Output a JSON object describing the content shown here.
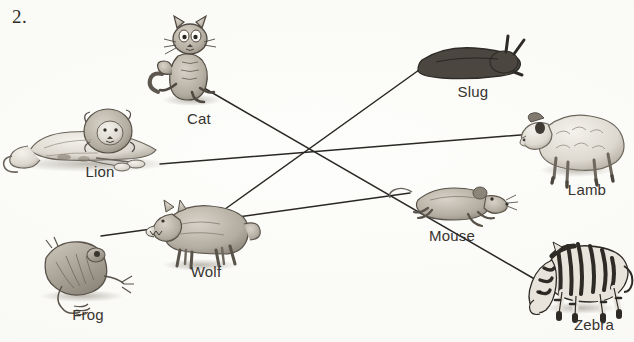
{
  "worksheet": {
    "exercise_number": "2.",
    "background_color": "#fdfdfb",
    "line_color": "#2a2724"
  },
  "labels": {
    "cat": "Cat",
    "lion": "Lion",
    "frog": "Frog",
    "wolf": "Wolf",
    "slug": "Slug",
    "lamb": "Lamb",
    "mouse": "Mouse",
    "zebra": "Zebra"
  },
  "animals": [
    {
      "id": "cat",
      "label": "Cat",
      "label_x": 199,
      "label_y": 119,
      "art_cx": 187,
      "art_cy": 68
    },
    {
      "id": "lion",
      "label": "Lion",
      "label_x": 100,
      "label_y": 172,
      "art_cx": 92,
      "art_cy": 141
    },
    {
      "id": "frog",
      "label": "Frog",
      "label_x": 88,
      "label_y": 315,
      "art_cx": 78,
      "art_cy": 268
    },
    {
      "id": "wolf",
      "label": "Wolf",
      "label_x": 206,
      "label_y": 272,
      "art_cx": 196,
      "art_cy": 232
    },
    {
      "id": "slug",
      "label": "Slug",
      "label_x": 473,
      "label_y": 92,
      "art_cx": 468,
      "art_cy": 58
    },
    {
      "id": "lamb",
      "label": "Lamb",
      "label_x": 587,
      "label_y": 190,
      "art_cx": 573,
      "art_cy": 144
    },
    {
      "id": "mouse",
      "label": "Mouse",
      "label_x": 452,
      "label_y": 236,
      "art_cx": 455,
      "art_cy": 203
    },
    {
      "id": "zebra",
      "label": "Zebra",
      "label_x": 594,
      "label_y": 325,
      "art_cx": 578,
      "art_cy": 275
    }
  ],
  "connections": [
    {
      "id": "lion-lamb",
      "from": "lion",
      "to": "lamb",
      "x1": 160,
      "y1": 164,
      "x2": 545,
      "y2": 133
    },
    {
      "id": "cat-zebra",
      "from": "cat",
      "to": "zebra",
      "x1": 204,
      "y1": 88,
      "x2": 538,
      "y2": 281
    },
    {
      "id": "slug-wolf",
      "from": "slug",
      "to": "wolf",
      "x1": 419,
      "y1": 70,
      "x2": 221,
      "y2": 212
    },
    {
      "id": "frog-mouse",
      "from": "frog",
      "to": "mouse",
      "x1": 101,
      "y1": 236,
      "x2": 410,
      "y2": 193
    }
  ]
}
